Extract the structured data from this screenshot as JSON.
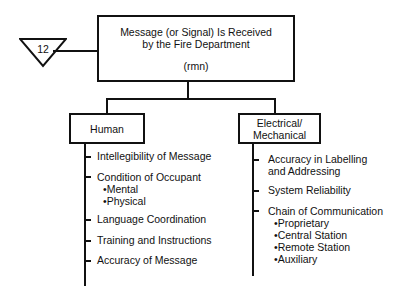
{
  "top_box": {
    "line1": "Message (or Signal) Is Received",
    "line2": "by the Fire Department",
    "code": "(rmn)"
  },
  "triangle": {
    "label": "12"
  },
  "branches": {
    "human": {
      "title": "Human",
      "items": [
        {
          "label": "Intellegibility of Message"
        },
        {
          "label": "Condition of Occupant",
          "sub": [
            "Mental",
            "Physical"
          ]
        },
        {
          "label": "Language Coordination"
        },
        {
          "label": "Training and Instructions"
        },
        {
          "label": "Accuracy of Message"
        }
      ]
    },
    "electrical": {
      "title_line1": "Electrical/",
      "title_line2": "Mechanical",
      "items": [
        {
          "label_line1": "Accuracy in Labelling",
          "label_line2": "and Addressing"
        },
        {
          "label": "System Reliability"
        },
        {
          "label": "Chain of Communication",
          "sub": [
            "Proprietary",
            "Central Station",
            "Remote Station",
            "Auxiliary"
          ]
        }
      ]
    }
  },
  "bullet": "•"
}
